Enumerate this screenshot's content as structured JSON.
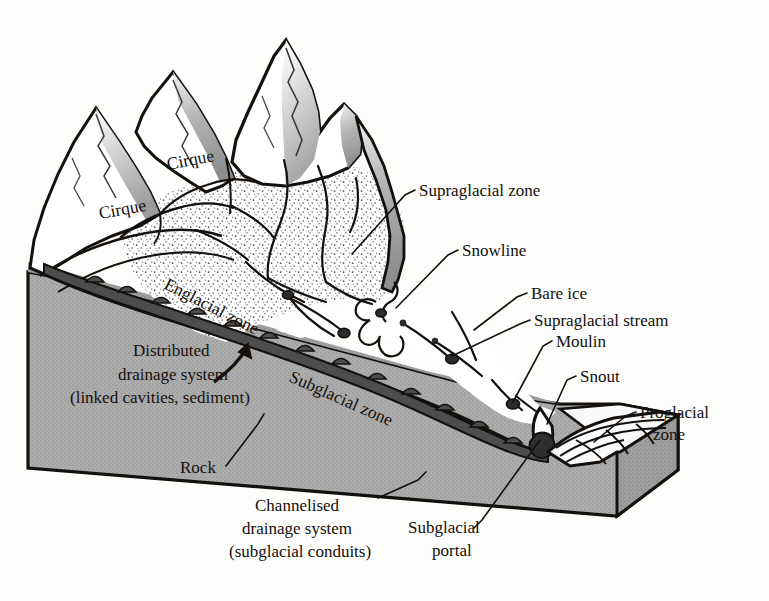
{
  "diagram": {
    "background_color": "#fdfdfc",
    "ink_color": "#14100d",
    "rock_fill": "#a9a9a9",
    "ice_fill": "#ffffff",
    "shadow_fill": "#8e8e8e"
  },
  "labels": {
    "cirque_upper": "Cirque",
    "cirque_lower": "Cirque",
    "englacial_zone": "Englacial zone",
    "subglacial_zone": "Subglacial zone",
    "supraglacial_zone": "Supraglacial zone",
    "snowline": "Snowline",
    "bare_ice": "Bare ice",
    "supraglacial_stream": "Supraglacial stream",
    "moulin": "Moulin",
    "snout": "Snout",
    "proglacial_zone_l1": "Proglacial",
    "proglacial_zone_l2": "zone",
    "rock": "Rock",
    "distributed_l1": "Distributed",
    "distributed_l2": "drainage system",
    "distributed_l3": "(linked cavities, sediment)",
    "channelised_l1": "Channelised",
    "channelised_l2": "drainage system",
    "channelised_l3": "(subglacial conduits)",
    "subglacial_portal_l1": "Subglacial",
    "subglacial_portal_l2": "portal"
  },
  "features": {
    "peaks": [
      "peak-left",
      "peak-mid",
      "peak-right-high",
      "peak-right"
    ],
    "moulin_count": 5,
    "zones": [
      "supraglacial",
      "englacial",
      "subglacial",
      "proglacial"
    ],
    "drainage_systems": [
      "distributed",
      "channelised"
    ]
  }
}
